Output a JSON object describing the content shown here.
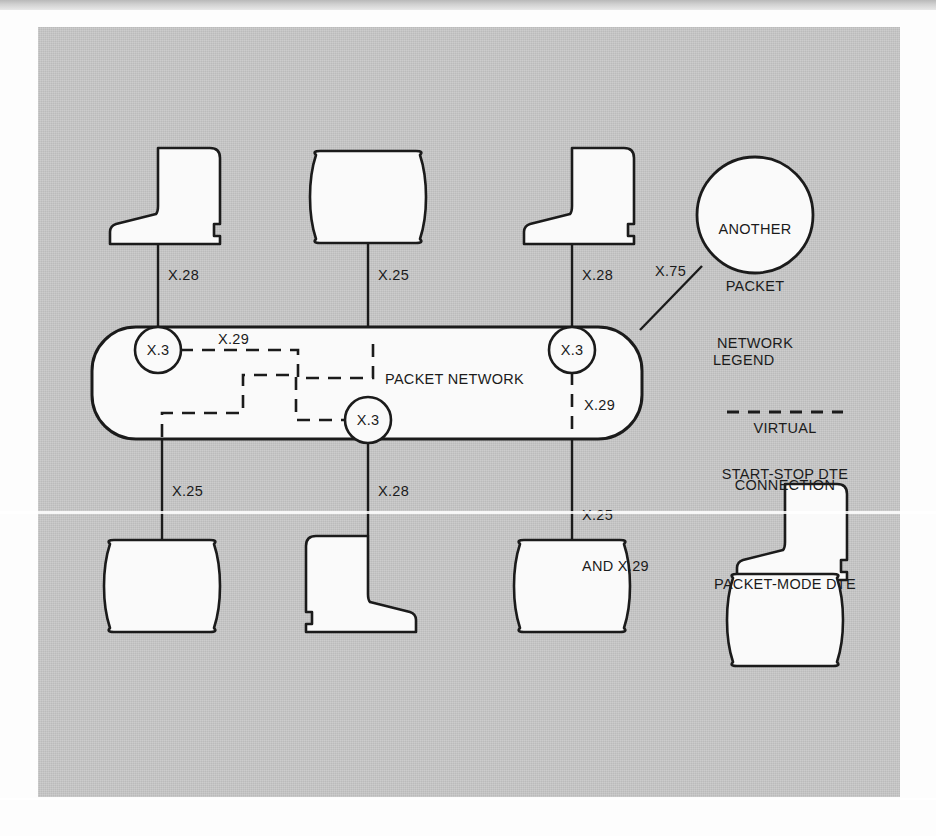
{
  "figure": {
    "network_label": "PACKET NETWORK",
    "external_network_label": "ANOTHER\nPACKET\nNETWORK",
    "external_network_lines": [
      "ANOTHER",
      "PACKET",
      "NETWORK"
    ],
    "background_color": "#c8c8c8",
    "shape_fill": "#fafafa",
    "line_color": "#1b1b1b"
  },
  "nodes": {
    "pad_label": "X.3",
    "pads": [
      {
        "id": "pad-left",
        "label": "X.3",
        "x": 158,
        "y": 350
      },
      {
        "id": "pad-middle",
        "label": "X.3",
        "x": 368,
        "y": 420
      },
      {
        "id": "pad-right",
        "label": "X.3",
        "x": 572,
        "y": 350
      }
    ]
  },
  "top_devices": [
    {
      "id": "top-dte-1",
      "type": "start-stop-dte",
      "interface": "X.28"
    },
    {
      "id": "top-dte-2",
      "type": "packet-mode-dte",
      "interface": "X.25"
    },
    {
      "id": "top-dte-3",
      "type": "start-stop-dte",
      "interface": "X.28"
    }
  ],
  "bottom_devices": [
    {
      "id": "bottom-dte-1",
      "type": "packet-mode-dte",
      "interface": "X.25"
    },
    {
      "id": "bottom-dte-2",
      "type": "start-stop-dte",
      "interface": "X.28"
    },
    {
      "id": "bottom-dte-3",
      "type": "packet-mode-dte",
      "interface": "X.25\nAND X.29"
    }
  ],
  "interface_labels": {
    "top_1": "X.28",
    "top_2": "X.25",
    "top_3": "X.28",
    "x75": "X.75",
    "x29_internal": "X.29",
    "x29_right": "X.29",
    "bottom_1": "X.25",
    "bottom_2": "X.28",
    "bottom_3_line1": "X.25",
    "bottom_3_line2": "AND X.29"
  },
  "legend": {
    "title": "LEGEND",
    "items": [
      {
        "label_line1": "VIRTUAL",
        "label_line2": "CONNECTION",
        "symbol": "dashed-line"
      },
      {
        "label": "START-STOP DTE",
        "symbol": "start-stop-dte-shape"
      },
      {
        "label": "PACKET-MODE DTE",
        "symbol": "packet-mode-dte-shape"
      }
    ]
  }
}
